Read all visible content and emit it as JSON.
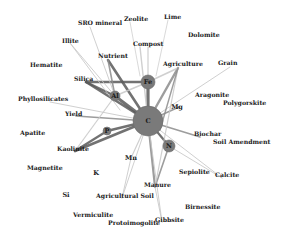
{
  "colors": {
    "node": "#7a7a7a",
    "node_stroke": "#6a6a6a",
    "edge_dark": "#5a5a5a",
    "edge_mid": "#8c8c8c",
    "edge_light": "#c8c8c8",
    "text": "#1a1a1a"
  },
  "nodes": [
    {
      "id": "C",
      "label": "C",
      "x": 148,
      "y": 121,
      "r": 15
    },
    {
      "id": "Fe",
      "label": "Fe",
      "x": 148,
      "y": 82,
      "r": 7
    },
    {
      "id": "Al",
      "label": "Al",
      "x": 115,
      "y": 96,
      "r": 5
    },
    {
      "id": "N",
      "label": "N",
      "x": 169,
      "y": 146,
      "r": 6
    },
    {
      "id": "P",
      "label": "P",
      "x": 107,
      "y": 131,
      "r": 4
    },
    {
      "id": "Mg",
      "label": "Mg",
      "x": 177,
      "y": 107,
      "r": 0
    },
    {
      "id": "Mn",
      "label": "Mn",
      "x": 131,
      "y": 158,
      "r": 0
    },
    {
      "id": "K",
      "label": "K",
      "x": 96,
      "y": 173,
      "r": 0
    },
    {
      "id": "Si",
      "label": "Si",
      "x": 66,
      "y": 195,
      "r": 0
    }
  ],
  "labels": [
    {
      "text": "SRO mineral",
      "x": 78,
      "y": 25
    },
    {
      "text": "Zeolite",
      "x": 124,
      "y": 21
    },
    {
      "text": "Lime",
      "x": 164,
      "y": 19
    },
    {
      "text": "Dolomite",
      "x": 188,
      "y": 37
    },
    {
      "text": "Illite",
      "x": 62,
      "y": 43
    },
    {
      "text": "Compost",
      "x": 133,
      "y": 46
    },
    {
      "text": "Nutrient",
      "x": 98,
      "y": 58
    },
    {
      "text": "Hematite",
      "x": 30,
      "y": 67
    },
    {
      "text": "Agriculture",
      "x": 163,
      "y": 66
    },
    {
      "text": "Grain",
      "x": 218,
      "y": 65
    },
    {
      "text": "Silica",
      "x": 74,
      "y": 81
    },
    {
      "text": "Aragonite",
      "x": 195,
      "y": 97
    },
    {
      "text": "Polygorskite",
      "x": 223,
      "y": 105
    },
    {
      "text": "Phyllosilicates",
      "x": 18,
      "y": 101
    },
    {
      "text": "Yield",
      "x": 65,
      "y": 116
    },
    {
      "text": "Biochar",
      "x": 194,
      "y": 136
    },
    {
      "text": "Soil Amendment",
      "x": 213,
      "y": 144
    },
    {
      "text": "Apatite",
      "x": 20,
      "y": 135
    },
    {
      "text": "Kaolinite",
      "x": 57,
      "y": 151
    },
    {
      "text": "Magnetite",
      "x": 27,
      "y": 170
    },
    {
      "text": "Sepiolite",
      "x": 179,
      "y": 174
    },
    {
      "text": "Calcite",
      "x": 215,
      "y": 177
    },
    {
      "text": "Manure",
      "x": 144,
      "y": 187
    },
    {
      "text": "Agricultural Soil",
      "x": 96,
      "y": 198
    },
    {
      "text": "Birnessite",
      "x": 185,
      "y": 209
    },
    {
      "text": "Vermiculite",
      "x": 73,
      "y": 217
    },
    {
      "text": "Gibbsite",
      "x": 155,
      "y": 222
    },
    {
      "text": "Protoimogolite",
      "x": 108,
      "y": 225
    }
  ],
  "edges": [
    {
      "x1": 148,
      "y1": 121,
      "x2": 148,
      "y2": 82,
      "w": 3.2,
      "c": "edge_dark"
    },
    {
      "x1": 148,
      "y1": 121,
      "x2": 115,
      "y2": 96,
      "w": 3,
      "c": "edge_dark"
    },
    {
      "x1": 148,
      "y1": 121,
      "x2": 107,
      "y2": 131,
      "w": 2.5,
      "c": "edge_dark"
    },
    {
      "x1": 148,
      "y1": 121,
      "x2": 169,
      "y2": 146,
      "w": 2.2,
      "c": "edge_dark"
    },
    {
      "x1": 148,
      "y1": 121,
      "x2": 108,
      "y2": 60,
      "w": 2.6,
      "c": "edge_dark"
    },
    {
      "x1": 148,
      "y1": 121,
      "x2": 86,
      "y2": 82,
      "w": 2.5,
      "c": "edge_dark"
    },
    {
      "x1": 148,
      "y1": 121,
      "x2": 75,
      "y2": 151,
      "w": 2.6,
      "c": "edge_dark"
    },
    {
      "x1": 148,
      "y1": 121,
      "x2": 155,
      "y2": 187,
      "w": 2.2,
      "c": "edge_mid"
    },
    {
      "x1": 148,
      "y1": 121,
      "x2": 178,
      "y2": 68,
      "w": 2.4,
      "c": "edge_mid"
    },
    {
      "x1": 148,
      "y1": 121,
      "x2": 76,
      "y2": 116,
      "w": 1.6,
      "c": "edge_mid"
    },
    {
      "x1": 148,
      "y1": 121,
      "x2": 200,
      "y2": 137,
      "w": 1.6,
      "c": "edge_mid"
    },
    {
      "x1": 148,
      "y1": 121,
      "x2": 179,
      "y2": 107,
      "w": 1.4,
      "c": "edge_mid"
    },
    {
      "x1": 148,
      "y1": 121,
      "x2": 131,
      "y2": 158,
      "w": 1.2,
      "c": "edge_light"
    },
    {
      "x1": 148,
      "y1": 121,
      "x2": 140,
      "y2": 47,
      "w": 1.4,
      "c": "edge_light"
    },
    {
      "x1": 148,
      "y1": 121,
      "x2": 230,
      "y2": 67,
      "w": 1,
      "c": "edge_light"
    },
    {
      "x1": 148,
      "y1": 121,
      "x2": 222,
      "y2": 178,
      "w": 1,
      "c": "edge_light"
    },
    {
      "x1": 148,
      "y1": 121,
      "x2": 50,
      "y2": 102,
      "w": 1,
      "c": "edge_light"
    },
    {
      "x1": 148,
      "y1": 121,
      "x2": 162,
      "y2": 222,
      "w": 1,
      "c": "edge_light"
    },
    {
      "x1": 148,
      "y1": 121,
      "x2": 122,
      "y2": 198,
      "w": 1,
      "c": "edge_light"
    },
    {
      "x1": 148,
      "y1": 82,
      "x2": 86,
      "y2": 82,
      "w": 2.4,
      "c": "edge_dark"
    },
    {
      "x1": 148,
      "y1": 82,
      "x2": 178,
      "y2": 68,
      "w": 1.6,
      "c": "edge_light"
    },
    {
      "x1": 148,
      "y1": 82,
      "x2": 115,
      "y2": 96,
      "w": 1.4,
      "c": "edge_light"
    },
    {
      "x1": 148,
      "y1": 82,
      "x2": 148,
      "y2": 47,
      "w": 1.2,
      "c": "edge_light"
    },
    {
      "x1": 115,
      "y1": 96,
      "x2": 86,
      "y2": 82,
      "w": 2.4,
      "c": "edge_dark"
    },
    {
      "x1": 115,
      "y1": 96,
      "x2": 108,
      "y2": 60,
      "w": 1.6,
      "c": "edge_mid"
    },
    {
      "x1": 115,
      "y1": 96,
      "x2": 70,
      "y2": 43,
      "w": 1,
      "c": "edge_light"
    },
    {
      "x1": 115,
      "y1": 96,
      "x2": 90,
      "y2": 27,
      "w": 1,
      "c": "edge_light"
    },
    {
      "x1": 115,
      "y1": 96,
      "x2": 75,
      "y2": 151,
      "w": 1.2,
      "c": "edge_light"
    },
    {
      "x1": 107,
      "y1": 131,
      "x2": 75,
      "y2": 151,
      "w": 2.2,
      "c": "edge_dark"
    },
    {
      "x1": 169,
      "y1": 146,
      "x2": 155,
      "y2": 187,
      "w": 1.6,
      "c": "edge_mid"
    },
    {
      "x1": 169,
      "y1": 146,
      "x2": 222,
      "y2": 178,
      "w": 1,
      "c": "edge_light"
    },
    {
      "x1": 178,
      "y1": 68,
      "x2": 155,
      "y2": 187,
      "w": 1.2,
      "c": "edge_light"
    },
    {
      "x1": 178,
      "y1": 68,
      "x2": 160,
      "y2": 130,
      "w": 1.4,
      "c": "edge_mid"
    },
    {
      "x1": 131,
      "y1": 158,
      "x2": 122,
      "y2": 198,
      "w": 1,
      "c": "edge_light"
    },
    {
      "x1": 155,
      "y1": 187,
      "x2": 162,
      "y2": 222,
      "w": 1,
      "c": "edge_light"
    },
    {
      "x1": 168,
      "y1": 20,
      "x2": 156,
      "y2": 76,
      "w": 0.8,
      "c": "edge_light"
    },
    {
      "x1": 130,
      "y1": 22,
      "x2": 140,
      "y2": 76,
      "w": 0.8,
      "c": "edge_light"
    },
    {
      "x1": 70,
      "y1": 43,
      "x2": 120,
      "y2": 110,
      "w": 1,
      "c": "edge_light"
    }
  ]
}
